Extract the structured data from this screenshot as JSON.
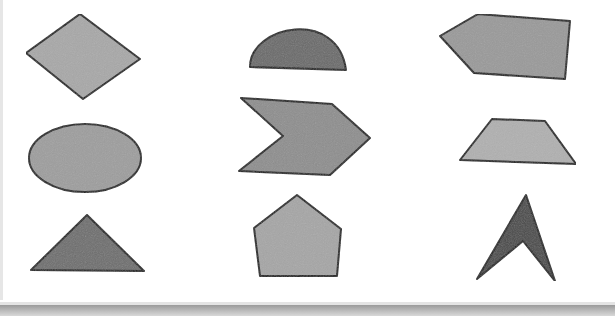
{
  "worksheet": {
    "background": "#ffffff",
    "stroke_color": "#1e1e1e",
    "stroke_width": 2,
    "shapes": [
      {
        "name": "rhombus",
        "kind": "polygon",
        "fill": "#a8a8a8",
        "points": "80,14 140,59 83,99 26,53"
      },
      {
        "name": "semicircle",
        "kind": "path",
        "fill": "#6b6b6b",
        "d": "M250,67 C250,25 338,8 346,70 Z"
      },
      {
        "name": "pentagon-arrow-left",
        "kind": "polygon",
        "fill": "#9a9a9a",
        "points": "478,14 570,21 565,79 474,73 440,36"
      },
      {
        "name": "ellipse",
        "kind": "ellipse",
        "fill": "#9e9e9e",
        "cx": 85,
        "cy": 158,
        "rx": 56,
        "ry": 34
      },
      {
        "name": "chevron",
        "kind": "polygon",
        "fill": "#8e8e8e",
        "points": "241,98 332,104 370,138 330,175 239,171 283,136"
      },
      {
        "name": "trapezoid",
        "kind": "polygon",
        "fill": "#b0b0b0",
        "points": "492,119 545,121 576,164 460,160"
      },
      {
        "name": "triangle",
        "kind": "polygon",
        "fill": "#6e6e6e",
        "points": "87,215 144,271 31,270"
      },
      {
        "name": "pentagon",
        "kind": "polygon",
        "fill": "#a6a6a6",
        "points": "297,195 341,229 337,276 260,276 254,228"
      },
      {
        "name": "arrowhead",
        "kind": "polygon",
        "fill": "#4a4a4a",
        "points": "526,195 555,281 523,241 477,279"
      }
    ]
  }
}
